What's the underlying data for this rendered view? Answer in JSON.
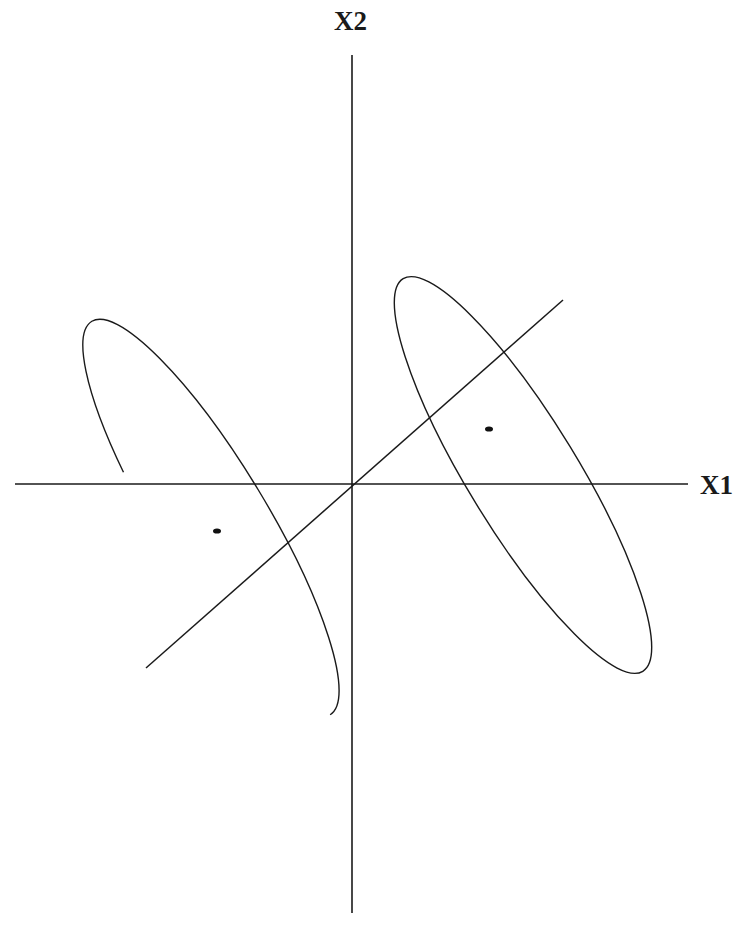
{
  "diagram": {
    "axes": {
      "x_label": "X1",
      "y_label": "X2"
    },
    "elements": [
      {
        "type": "axis",
        "name": "X1 axis (horizontal)"
      },
      {
        "type": "axis",
        "name": "X2 axis (vertical)"
      },
      {
        "type": "line",
        "name": "diagonal discriminant direction through origin"
      },
      {
        "type": "ellipse",
        "name": "left class ellipse",
        "orientation": "tilted, long axis from upper-left to lower-right"
      },
      {
        "type": "ellipse",
        "name": "right class ellipse",
        "orientation": "tilted, long axis from upper-left to lower-right"
      },
      {
        "type": "point",
        "name": "left class mean"
      },
      {
        "type": "point",
        "name": "right class mean"
      }
    ],
    "colors": {
      "stroke": "#1a1a1a",
      "background": "#ffffff"
    }
  }
}
